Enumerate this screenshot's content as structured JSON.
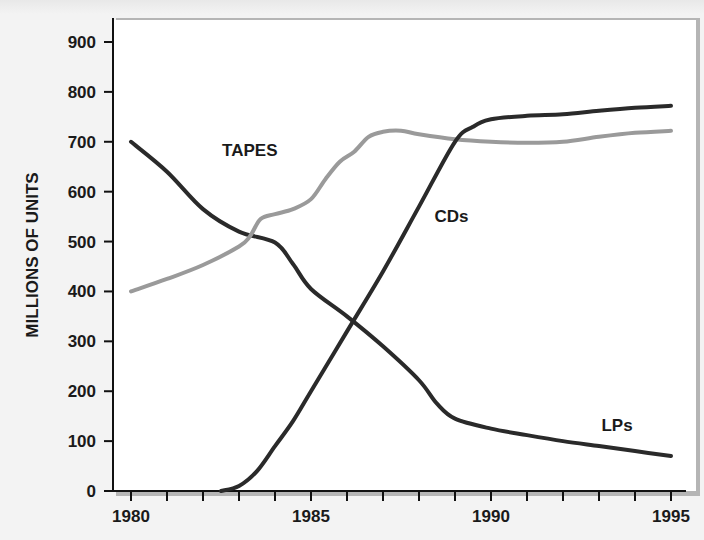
{
  "chart_data": {
    "type": "line",
    "title": "",
    "xlabel": "",
    "ylabel": "MILLIONS OF UNITS",
    "xlim": [
      1980,
      1995
    ],
    "ylim": [
      0,
      900
    ],
    "x_ticks": [
      1980,
      1985,
      1990,
      1995
    ],
    "x_minor_ticks_per_year": true,
    "y_ticks": [
      0,
      100,
      200,
      300,
      400,
      500,
      600,
      700,
      800,
      900
    ],
    "grid": false,
    "legend": "inline labels",
    "series": [
      {
        "name": "LPs",
        "color": "#2a2a2a",
        "label_position": {
          "x": 1993.5,
          "y": 120
        },
        "points": [
          [
            1980,
            700
          ],
          [
            1981,
            640
          ],
          [
            1982,
            565
          ],
          [
            1983,
            520
          ],
          [
            1984,
            498
          ],
          [
            1984.5,
            455
          ],
          [
            1985,
            405
          ],
          [
            1986,
            350
          ],
          [
            1987,
            290
          ],
          [
            1988,
            222
          ],
          [
            1988.5,
            175
          ],
          [
            1989,
            145
          ],
          [
            1990,
            125
          ],
          [
            1991,
            112
          ],
          [
            1992,
            100
          ],
          [
            1993,
            90
          ],
          [
            1994,
            80
          ],
          [
            1995,
            70
          ]
        ]
      },
      {
        "name": "TAPES",
        "color": "#9a9a9a",
        "label_position": {
          "x": 1983.3,
          "y": 672
        },
        "points": [
          [
            1980,
            400
          ],
          [
            1981,
            425
          ],
          [
            1982,
            453
          ],
          [
            1983,
            490
          ],
          [
            1983.3,
            510
          ],
          [
            1983.6,
            545
          ],
          [
            1984,
            555
          ],
          [
            1984.5,
            565
          ],
          [
            1985,
            585
          ],
          [
            1985.4,
            625
          ],
          [
            1985.8,
            660
          ],
          [
            1986.2,
            680
          ],
          [
            1986.6,
            710
          ],
          [
            1987,
            720
          ],
          [
            1987.5,
            722
          ],
          [
            1988,
            715
          ],
          [
            1989,
            705
          ],
          [
            1990,
            700
          ],
          [
            1991,
            698
          ],
          [
            1992,
            700
          ],
          [
            1993,
            710
          ],
          [
            1994,
            718
          ],
          [
            1995,
            722
          ]
        ]
      },
      {
        "name": "CDs",
        "color": "#2a2a2a",
        "label_position": {
          "x": 1988.9,
          "y": 540
        },
        "points": [
          [
            1982.5,
            0
          ],
          [
            1983,
            10
          ],
          [
            1983.5,
            40
          ],
          [
            1984,
            90
          ],
          [
            1984.5,
            140
          ],
          [
            1985,
            200
          ],
          [
            1986,
            320
          ],
          [
            1987,
            440
          ],
          [
            1988,
            570
          ],
          [
            1989,
            700
          ],
          [
            1989.5,
            730
          ],
          [
            1990,
            745
          ],
          [
            1991,
            752
          ],
          [
            1992,
            755
          ],
          [
            1993,
            762
          ],
          [
            1994,
            768
          ],
          [
            1995,
            772
          ]
        ]
      }
    ]
  },
  "labels": {
    "ylabel": "MILLIONS OF UNITS",
    "lps": "LPs",
    "tapes": "TAPES",
    "cds": "CDs"
  }
}
